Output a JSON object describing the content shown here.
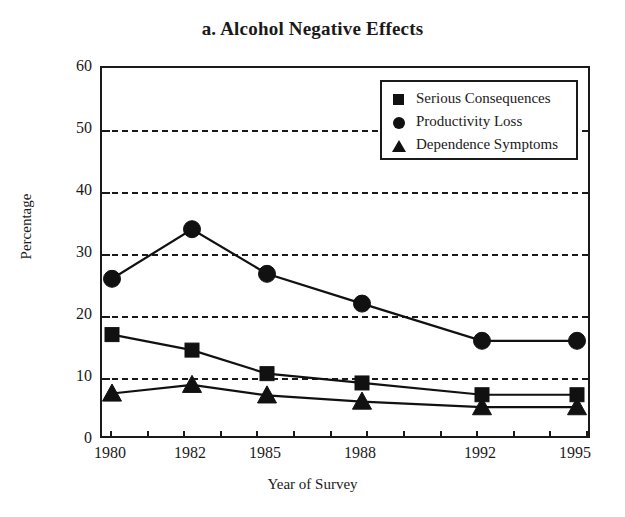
{
  "chart_data": {
    "type": "line",
    "title": "a. Alcohol Negative Effects",
    "xlabel": "Year of Survey",
    "ylabel": "Percentage",
    "categories": [
      "1980",
      "1982",
      "1985",
      "1988",
      "1992",
      "1995"
    ],
    "ylim": [
      0,
      60
    ],
    "yticks": [
      0,
      10,
      20,
      30,
      40,
      50,
      60
    ],
    "ytick_labels": [
      "0",
      "10",
      "20",
      "30",
      "40",
      "50",
      "60"
    ],
    "grid": true,
    "grid_axis": "y",
    "grid_style": "dashed",
    "legend_position": "top-right",
    "series": [
      {
        "name": "Serious Consequences",
        "marker": "square",
        "values": [
          17.0,
          14.5,
          10.7,
          9.2,
          7.3,
          7.3
        ]
      },
      {
        "name": "Productivity Loss",
        "marker": "circle",
        "values": [
          26.0,
          34.0,
          26.8,
          22.0,
          16.0,
          16.0
        ]
      },
      {
        "name": "Dependence Symptoms",
        "marker": "triangle",
        "values": [
          7.5,
          8.9,
          7.2,
          6.2,
          5.3,
          5.3
        ]
      }
    ]
  },
  "legend": {
    "entries": [
      {
        "label": "Serious Consequences",
        "icon": "square-marker-icon"
      },
      {
        "label": "Productivity Loss",
        "icon": "circle-marker-icon"
      },
      {
        "label": "Dependence Symptoms",
        "icon": "triangle-marker-icon"
      }
    ]
  },
  "colors": {
    "ink": "#111111",
    "background": "#ffffff"
  }
}
